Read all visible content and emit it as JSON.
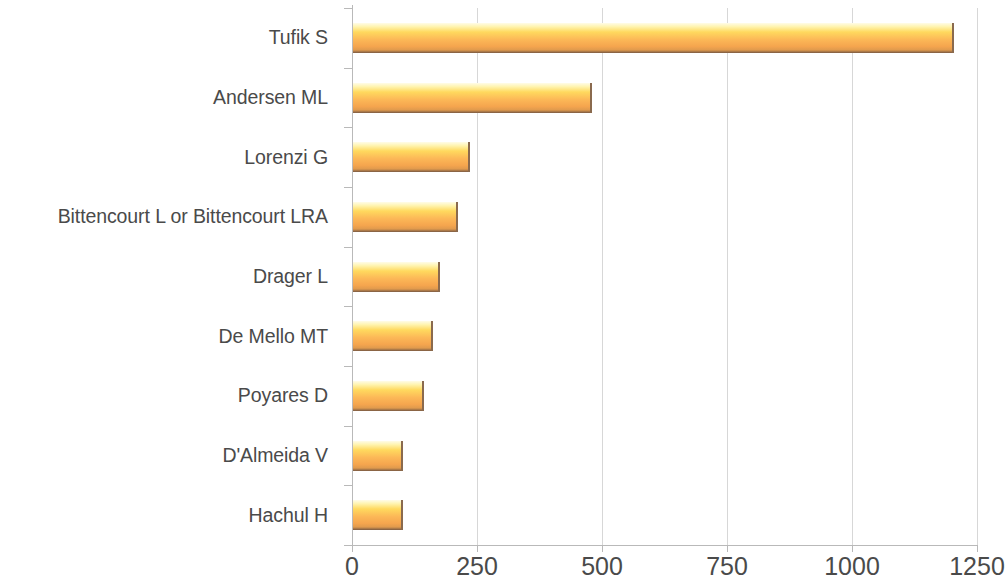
{
  "chart_data": {
    "type": "bar",
    "orientation": "horizontal",
    "title": "",
    "subtitle": "",
    "xlabel": "",
    "ylabel": "",
    "grid": true,
    "legend": false,
    "xlim": [
      0,
      1250
    ],
    "xticks": [
      0,
      250,
      500,
      750,
      1000,
      1250
    ],
    "xtick_labels": [
      "0",
      "250",
      "500",
      "750",
      "1000",
      "1250"
    ],
    "categories": [
      "Tufik S",
      "Andersen ML",
      "Lorenzi G",
      "Bittencourt L or Bittencourt LRA",
      "Drager L",
      "De Mello MT",
      "Poyares D",
      "D'Almeida V",
      "Hachul H"
    ],
    "values": [
      1203,
      480,
      236,
      212,
      176,
      162,
      144,
      102,
      102
    ],
    "bar_color_top": "#fff4b0",
    "bar_color_mid": "#fcb857",
    "bar_color_bottom": "#7a5a43",
    "axis_color": "#b9b9b9",
    "grid_color": "#d7d7d7",
    "text_color": "#4a4a4a"
  }
}
